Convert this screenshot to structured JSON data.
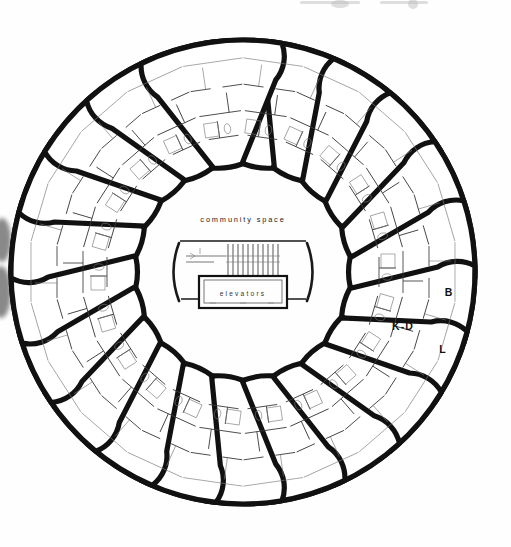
{
  "plan": {
    "type": "radial-petal-floor-plan",
    "title_visible": false,
    "petal_count": 22,
    "center": {
      "x": 243,
      "y": 272
    },
    "ring": {
      "outer_radius": 232,
      "inner_radius": 108,
      "petal_half_angle_deg": 7.6,
      "outline_color": "#111111",
      "fill_color": "#ffffff"
    },
    "core": {
      "community_space_label": "community space",
      "community_space_label_pos": {
        "x": 243,
        "y": 220
      },
      "elevators_label": "elevators",
      "elevators_box": {
        "x": 199,
        "y": 276,
        "width": 88,
        "height": 32
      },
      "stair_run_count": 11,
      "left_arc": true,
      "right_arc": true
    },
    "room_labels": [
      {
        "code": "B",
        "meaning": "bedroom",
        "x": 449,
        "y": 296
      },
      {
        "code": "K-D",
        "meaning": "kitchen-dining",
        "x": 403,
        "y": 330
      },
      {
        "code": "L",
        "meaning": "living",
        "x": 443,
        "y": 353
      }
    ],
    "colors": {
      "ink": "#111111",
      "paper": "#ffffff",
      "thin_line": "#555555",
      "label_text": "#222222"
    },
    "artifacts": {
      "left_edge_smudge": true,
      "top_cropped_header_ghost": true
    }
  }
}
